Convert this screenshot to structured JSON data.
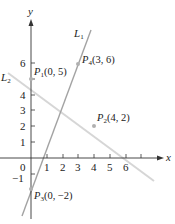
{
  "diagram": {
    "type": "coordinate-plane",
    "axes": {
      "x_label": "x",
      "y_label": "y",
      "x_ticks": [
        "1",
        "2",
        "3",
        "4",
        "5",
        "6"
      ],
      "y_ticks": [
        "1",
        "2",
        "3",
        "4",
        "5",
        "6"
      ],
      "neg_y_tick": "−1",
      "origin_label": "0"
    },
    "lines": [
      {
        "name": "L",
        "sub": "1",
        "through": [
          [
            0,
            -2
          ],
          [
            3,
            6
          ]
        ],
        "color": "#9e9e9e"
      },
      {
        "name": "L",
        "sub": "2",
        "through": [
          [
            0,
            5
          ],
          [
            4,
            2
          ]
        ],
        "color": "#d4d4d4"
      }
    ],
    "points": [
      {
        "name": "P",
        "sub": "1",
        "coords": "(0, 5)",
        "x": 0,
        "y": 5
      },
      {
        "name": "P",
        "sub": "2",
        "coords": "(4, 2)",
        "x": 4,
        "y": 2
      },
      {
        "name": "P",
        "sub": "3",
        "coords": "(0, −2)",
        "x": 0,
        "y": -2
      },
      {
        "name": "P",
        "sub": "4",
        "coords": "(3, 6)",
        "x": 3,
        "y": 6
      }
    ]
  }
}
